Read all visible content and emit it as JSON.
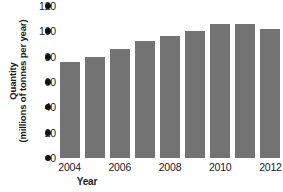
{
  "chart_data": {
    "type": "bar",
    "title": "",
    "xlabel": "Year",
    "ylabel": "Quantity (millions of tonnes per year)",
    "ylabel_line1": "Quantity",
    "ylabel_line2": "(millions of tonnes per year)",
    "categories": [
      "2004",
      "2005",
      "2006",
      "2007",
      "2008",
      "2009",
      "2010",
      "2011",
      "2012"
    ],
    "values": [
      76,
      80,
      86,
      92,
      96,
      100,
      106,
      106,
      102
    ],
    "ylim": [
      0,
      120
    ],
    "yticks": [
      0,
      20,
      40,
      60,
      80,
      100,
      120
    ],
    "ytick_labels": [
      "0",
      "20",
      "40",
      "60",
      "80",
      "100",
      "120"
    ],
    "xtick_labels": [
      "2004",
      "2006",
      "2008",
      "2010",
      "2012"
    ],
    "xtick_categories": [
      "2004",
      "2006",
      "2008",
      "2010",
      "2012"
    ],
    "grid": false,
    "legend": null,
    "bar_color": "#737373",
    "axis_marker_color": "#111111",
    "text_color": "#1a1a1a",
    "background": "#ffffff"
  }
}
